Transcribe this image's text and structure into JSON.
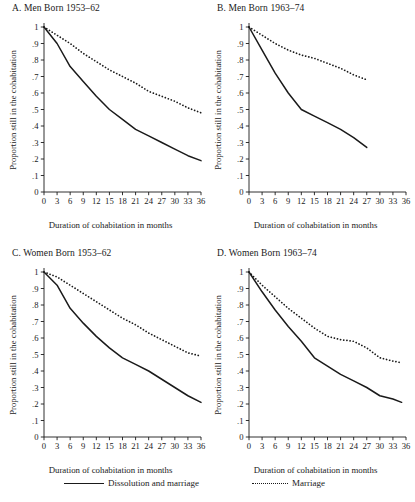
{
  "figure": {
    "legend": {
      "solid_label": "Dissolution and marriage",
      "dotted_label": "Marriage"
    }
  },
  "chart_data": [
    {
      "type": "line",
      "panel": "A",
      "title": "A. Men Born 1953–62",
      "xlabel": "Duration of cohabitation in months",
      "ylabel": "Proportion still in the cohabitation",
      "xlim": [
        0,
        36
      ],
      "ylim": [
        0,
        1
      ],
      "xticks": [
        0,
        3,
        6,
        9,
        12,
        15,
        18,
        21,
        24,
        27,
        30,
        33,
        36
      ],
      "xticklabels": [
        "0",
        "3",
        "6",
        "9",
        "12",
        "15",
        "18",
        "21",
        "24",
        "27",
        "30",
        "33",
        "36"
      ],
      "yticks": [
        0,
        0.1,
        0.2,
        0.3,
        0.4,
        0.5,
        0.6,
        0.7,
        0.8,
        0.9,
        1
      ],
      "yticklabels": [
        "0",
        ".1",
        ".2",
        ".3",
        ".4",
        ".5",
        ".6",
        ".7",
        ".8",
        ".9",
        "1"
      ],
      "grid": false,
      "legend_position": "below figure",
      "x": [
        0,
        3,
        6,
        9,
        12,
        15,
        18,
        21,
        24,
        27,
        30,
        33,
        36
      ],
      "series": [
        {
          "name": "Dissolution and marriage",
          "style": "solid",
          "values": [
            1.0,
            0.9,
            0.76,
            0.67,
            0.58,
            0.5,
            0.44,
            0.38,
            0.34,
            0.3,
            0.26,
            0.22,
            0.19
          ]
        },
        {
          "name": "Marriage",
          "style": "dotted",
          "values": [
            1.0,
            0.95,
            0.9,
            0.84,
            0.79,
            0.74,
            0.7,
            0.66,
            0.61,
            0.58,
            0.55,
            0.51,
            0.48
          ]
        }
      ]
    },
    {
      "type": "line",
      "panel": "B",
      "title": "B. Men Born 1963–74",
      "xlabel": "Duration of cohabitation in months",
      "ylabel": "Proportion still in the cohabitation",
      "xlim": [
        0,
        36
      ],
      "ylim": [
        0,
        1
      ],
      "xticks": [
        0,
        3,
        6,
        9,
        12,
        15,
        18,
        21,
        24,
        27,
        30,
        33,
        36
      ],
      "xticklabels": [
        "0",
        "3",
        "6",
        "9",
        "12",
        "15",
        "18",
        "21",
        "24",
        "27",
        "30",
        "33",
        "36"
      ],
      "yticks": [
        0,
        0.1,
        0.2,
        0.3,
        0.4,
        0.5,
        0.6,
        0.7,
        0.8,
        0.9,
        1
      ],
      "yticklabels": [
        "0",
        ".1",
        ".2",
        ".3",
        ".4",
        ".5",
        ".6",
        ".7",
        ".8",
        ".9",
        "1"
      ],
      "grid": false,
      "legend_position": "below figure",
      "x": [
        0,
        3,
        6,
        9,
        12,
        15,
        18,
        21,
        24,
        27
      ],
      "series": [
        {
          "name": "Dissolution and marriage",
          "style": "solid",
          "values": [
            1.0,
            0.86,
            0.72,
            0.6,
            0.5,
            0.46,
            0.42,
            0.38,
            0.33,
            0.27
          ]
        },
        {
          "name": "Marriage",
          "style": "dotted",
          "values": [
            1.0,
            0.95,
            0.9,
            0.86,
            0.83,
            0.81,
            0.78,
            0.75,
            0.71,
            0.68
          ]
        }
      ]
    },
    {
      "type": "line",
      "panel": "C",
      "title": "C. Women Born 1953–62",
      "xlabel": "Duration of cohabitation in months",
      "ylabel": "Proportion still in the cohabitation",
      "xlim": [
        0,
        36
      ],
      "ylim": [
        0,
        1
      ],
      "xticks": [
        0,
        3,
        6,
        9,
        12,
        15,
        18,
        21,
        24,
        27,
        30,
        33,
        36
      ],
      "xticklabels": [
        "0",
        "3",
        "6",
        "9",
        "12",
        "15",
        "18",
        "21",
        "24",
        "27",
        "30",
        "33",
        "36"
      ],
      "yticks": [
        0,
        0.1,
        0.2,
        0.3,
        0.4,
        0.5,
        0.6,
        0.7,
        0.8,
        0.9,
        1
      ],
      "yticklabels": [
        "0",
        ".1",
        ".2",
        ".3",
        ".4",
        ".5",
        ".6",
        ".7",
        ".8",
        ".9",
        "1"
      ],
      "grid": false,
      "legend_position": "below figure",
      "x": [
        0,
        3,
        6,
        9,
        12,
        15,
        18,
        21,
        24,
        27,
        30,
        33,
        36
      ],
      "series": [
        {
          "name": "Dissolution and marriage",
          "style": "solid",
          "values": [
            1.0,
            0.92,
            0.78,
            0.69,
            0.61,
            0.54,
            0.48,
            0.44,
            0.4,
            0.35,
            0.3,
            0.25,
            0.21
          ]
        },
        {
          "name": "Marriage",
          "style": "dotted",
          "values": [
            1.0,
            0.97,
            0.92,
            0.87,
            0.82,
            0.77,
            0.72,
            0.68,
            0.63,
            0.59,
            0.55,
            0.51,
            0.49
          ]
        }
      ]
    },
    {
      "type": "line",
      "panel": "D",
      "title": "D. Women Born 1963–74",
      "xlabel": "Duration of cohabitation in months",
      "ylabel": "Proportion still in the cohabitation",
      "xlim": [
        0,
        36
      ],
      "ylim": [
        0,
        1
      ],
      "xticks": [
        0,
        3,
        6,
        9,
        12,
        15,
        18,
        21,
        24,
        27,
        30,
        33,
        36
      ],
      "xticklabels": [
        "0",
        "3",
        "6",
        "9",
        "12",
        "15",
        "18",
        "21",
        "24",
        "27",
        "30",
        "33",
        "36"
      ],
      "yticks": [
        0,
        0.1,
        0.2,
        0.3,
        0.4,
        0.5,
        0.6,
        0.7,
        0.8,
        0.9,
        1
      ],
      "yticklabels": [
        "0",
        ".1",
        ".2",
        ".3",
        ".4",
        ".5",
        ".6",
        ".7",
        ".8",
        ".9",
        "1"
      ],
      "grid": false,
      "legend_position": "below figure",
      "x": [
        0,
        3,
        6,
        9,
        12,
        15,
        18,
        21,
        24,
        27,
        30,
        33,
        35
      ],
      "series": [
        {
          "name": "Dissolution and marriage",
          "style": "solid",
          "values": [
            1.0,
            0.88,
            0.77,
            0.67,
            0.58,
            0.48,
            0.43,
            0.38,
            0.34,
            0.3,
            0.25,
            0.23,
            0.21
          ]
        },
        {
          "name": "Marriage",
          "style": "dotted",
          "values": [
            1.0,
            0.92,
            0.85,
            0.78,
            0.72,
            0.66,
            0.61,
            0.59,
            0.58,
            0.54,
            0.48,
            0.46,
            0.45
          ]
        }
      ]
    }
  ]
}
